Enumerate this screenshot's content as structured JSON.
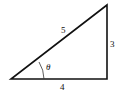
{
  "diagram": {
    "type": "right-triangle",
    "labels": {
      "hypotenuse": "5",
      "opposite": "3",
      "adjacent": "4",
      "angle": "θ"
    },
    "stroke_color": "#111111"
  }
}
